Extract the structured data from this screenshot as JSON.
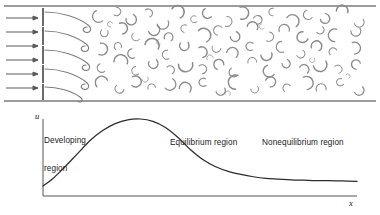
{
  "figure": {
    "panels": {
      "top": {
        "name": "flow-field-panel",
        "description": "Inflow arrows entering a channel bounded by a ribbed wall, with shed vortices filling the field",
        "inflow_arrow_count": 6,
        "rib_count": 5,
        "vortex_glyph_count": 86,
        "frame": {
          "top_rule_y": 6,
          "bottom_rule_y": 101,
          "left_x": 4,
          "right_x": 376
        },
        "wall_x": 43
      },
      "bottom": {
        "name": "velocity-profile-panel",
        "axis": {
          "origin_x": 43,
          "origin_y": 196,
          "y_top": 119,
          "x_right": 357
        }
      }
    },
    "labels": {
      "y_axis": "u",
      "x_axis": "x",
      "developing_region_line1": "Developing",
      "developing_region_line2": "region",
      "equilibrium_region": "Equilibrium region",
      "nonequilibrium_region": "Nonequilibrium region"
    },
    "colors": {
      "line": "#2b2b2b",
      "axis": "#555555",
      "vortex": "#8a8a8a",
      "arrow": "#5a5a5a",
      "text": "#222222",
      "background": "#ffffff"
    }
  },
  "chart_data": {
    "type": "line",
    "xlabel": "x",
    "ylabel": "u",
    "grid": false,
    "legend": null,
    "xlim": [
      0,
      100
    ],
    "ylim": [
      0,
      100
    ],
    "annotations": [
      {
        "text": "Developing region",
        "x": 4,
        "y": 92
      },
      {
        "text": "Equilibrium region",
        "x": 45,
        "y": 72
      },
      {
        "text": "Nonequilibrium region",
        "x": 76,
        "y": 72
      }
    ],
    "series": [
      {
        "name": "u",
        "x": [
          0,
          3,
          7,
          11,
          15,
          19,
          23,
          27,
          31,
          35,
          39,
          43,
          47,
          51,
          55,
          59,
          63,
          67,
          71,
          75,
          79,
          83,
          87,
          91,
          95,
          100
        ],
        "y": [
          13,
          22,
          38,
          55,
          72,
          85,
          94,
          99,
          100,
          97,
          89,
          76,
          60,
          47,
          38,
          32,
          28,
          25,
          23,
          22,
          21,
          20.5,
          20,
          20,
          19.5,
          19
        ]
      }
    ]
  }
}
